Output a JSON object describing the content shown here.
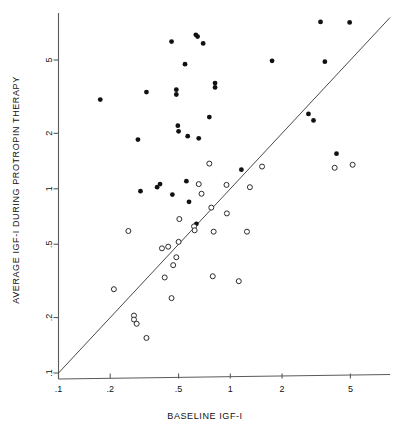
{
  "figure": {
    "background_color": "#ffffff",
    "ink_color": "#111111",
    "axis_color": "#5a5a5a"
  },
  "chart_data": {
    "type": "scatter",
    "title": "",
    "xlabel": "BASELINE IGF-I",
    "ylabel": "AVERAGE IGF-I DURING PROTROPIN THERAPY",
    "xscale": "log",
    "yscale": "log",
    "xlim": [
      0.1,
      8.5
    ],
    "ylim": [
      0.1,
      9.0
    ],
    "grid": false,
    "legend": "none",
    "xticks": [
      0.1,
      0.2,
      0.5,
      1,
      2,
      5
    ],
    "xtick_labels": [
      ".1",
      ".2",
      ".5",
      "1",
      "2",
      "5"
    ],
    "yticks": [
      0.1,
      0.2,
      0.5,
      1,
      2,
      5
    ],
    "ytick_labels": [
      ".1",
      ".2",
      ".5",
      "1",
      "2",
      "5"
    ],
    "annotations": [
      {
        "name": "identity-line",
        "type": "line",
        "description": "diagonal line of identity y = x",
        "from": [
          0.1,
          0.1
        ],
        "to": [
          8.5,
          8.5
        ]
      }
    ],
    "series": [
      {
        "name": "filled-circles",
        "marker": "filled-circle",
        "color": "#111111",
        "points": [
          [
            0.175,
            3.05
          ],
          [
            0.29,
            1.85
          ],
          [
            0.3,
            0.97
          ],
          [
            0.325,
            3.35
          ],
          [
            0.375,
            1.02
          ],
          [
            0.39,
            1.06
          ],
          [
            0.455,
            6.3
          ],
          [
            0.46,
            0.93
          ],
          [
            0.485,
            3.45
          ],
          [
            0.485,
            3.25
          ],
          [
            0.495,
            2.2
          ],
          [
            0.5,
            2.05
          ],
          [
            0.545,
            4.75
          ],
          [
            0.555,
            1.1
          ],
          [
            0.565,
            1.93
          ],
          [
            0.575,
            0.85
          ],
          [
            0.63,
            6.85
          ],
          [
            0.645,
            6.7
          ],
          [
            0.655,
            1.88
          ],
          [
            0.695,
            6.15
          ],
          [
            0.755,
            2.45
          ],
          [
            0.815,
            3.75
          ],
          [
            0.815,
            3.55
          ],
          [
            0.635,
            0.645
          ],
          [
            1.16,
            1.27
          ],
          [
            1.75,
            4.95
          ],
          [
            2.85,
            2.55
          ],
          [
            3.05,
            2.35
          ],
          [
            3.35,
            8.05
          ],
          [
            3.55,
            4.9
          ],
          [
            4.15,
            1.55
          ],
          [
            4.95,
            8.0
          ]
        ]
      },
      {
        "name": "open-circles",
        "marker": "open-circle",
        "color": "#2b2b2b",
        "points": [
          [
            0.21,
            0.285
          ],
          [
            0.255,
            0.59
          ],
          [
            0.275,
            0.205
          ],
          [
            0.275,
            0.195
          ],
          [
            0.285,
            0.185
          ],
          [
            0.325,
            0.155
          ],
          [
            0.4,
            0.475
          ],
          [
            0.415,
            0.33
          ],
          [
            0.435,
            0.485
          ],
          [
            0.455,
            0.255
          ],
          [
            0.465,
            0.385
          ],
          [
            0.485,
            0.425
          ],
          [
            0.5,
            0.515
          ],
          [
            0.505,
            0.685
          ],
          [
            0.615,
            0.625
          ],
          [
            0.62,
            0.595
          ],
          [
            0.655,
            1.06
          ],
          [
            0.68,
            0.94
          ],
          [
            0.755,
            1.37
          ],
          [
            0.775,
            0.79
          ],
          [
            0.79,
            0.335
          ],
          [
            0.8,
            0.585
          ],
          [
            0.95,
            1.05
          ],
          [
            0.955,
            0.735
          ],
          [
            1.12,
            0.315
          ],
          [
            1.25,
            0.585
          ],
          [
            1.3,
            1.02
          ],
          [
            1.53,
            1.32
          ],
          [
            4.05,
            1.3
          ],
          [
            5.15,
            1.35
          ]
        ]
      }
    ]
  }
}
